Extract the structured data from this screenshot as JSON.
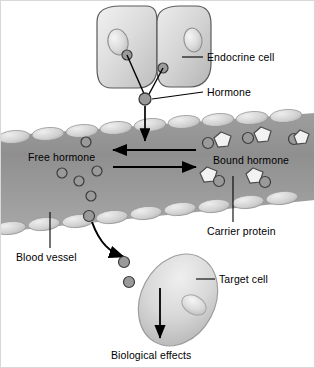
{
  "diagram": {
    "background_color": "#ffffff",
    "palette": {
      "cell_fill_light": "#e8e8e8",
      "cell_fill_mid": "#c9c9c9",
      "cell_outline": "#555555",
      "nucleus_fill": "#dcdcdc",
      "vessel_fill_dark": "#8c8c8c",
      "vessel_fill_light": "#b4b4b4",
      "endothelium_fill": "#cfcfcf",
      "hormone_fill": "#9a9a9a",
      "hormone_outline": "#3c3c3c",
      "carrier_fill": "#f2f2f2",
      "carrier_outline": "#4a4a4a",
      "arrow_color": "#000000",
      "leader_color": "#000000",
      "text_color": "#000000"
    },
    "labels": [
      {
        "id": "endocrine-cell",
        "text": "Endocrine cell",
        "x": 207,
        "y": 52
      },
      {
        "id": "hormone",
        "text": "Hormone",
        "x": 207,
        "y": 87
      },
      {
        "id": "free-hormone",
        "text": "Free hormone",
        "x": 28,
        "y": 152
      },
      {
        "id": "bound-hormone",
        "text": "Bound hormone",
        "x": 213,
        "y": 155
      },
      {
        "id": "carrier-protein",
        "text": "Carrier protein",
        "x": 207,
        "y": 226
      },
      {
        "id": "blood-vessel",
        "text": "Blood vessel",
        "x": 16,
        "y": 252
      },
      {
        "id": "target-cell",
        "text": "Target cell",
        "x": 219,
        "y": 274
      },
      {
        "id": "biological-effects",
        "text": "Biological effects",
        "x": 111,
        "y": 350
      }
    ],
    "structures": {
      "endocrine_cells": {
        "count": 2,
        "description": "Two adjoining rounded cells with oval nuclei",
        "nuclei": 2,
        "internal_hormones": 2
      },
      "blood_vessel": {
        "description": "Diagonal vessel lumen lined with oval endothelial cells",
        "endothelial_cells_top": 9,
        "endothelial_cells_bottom": 9
      },
      "free_hormones_in_vessel": 6,
      "bound_hormone_complexes": 5,
      "hormones_exiting_vessel": 2,
      "target_cell": {
        "description": "Tilted ellipse cell with offset nucleus",
        "nucleus": 1
      }
    },
    "arrows": {
      "secretion_into_vessel": "downward arrow from hormone into vessel lumen",
      "equilibrium_left": "leftward arrow (bound to free)",
      "equilibrium_right": "rightward arrow (free to bound)",
      "exit_vessel": "curved arrow from vessel to target cell",
      "effects": "downward arrow from target cell to biological effects"
    }
  }
}
